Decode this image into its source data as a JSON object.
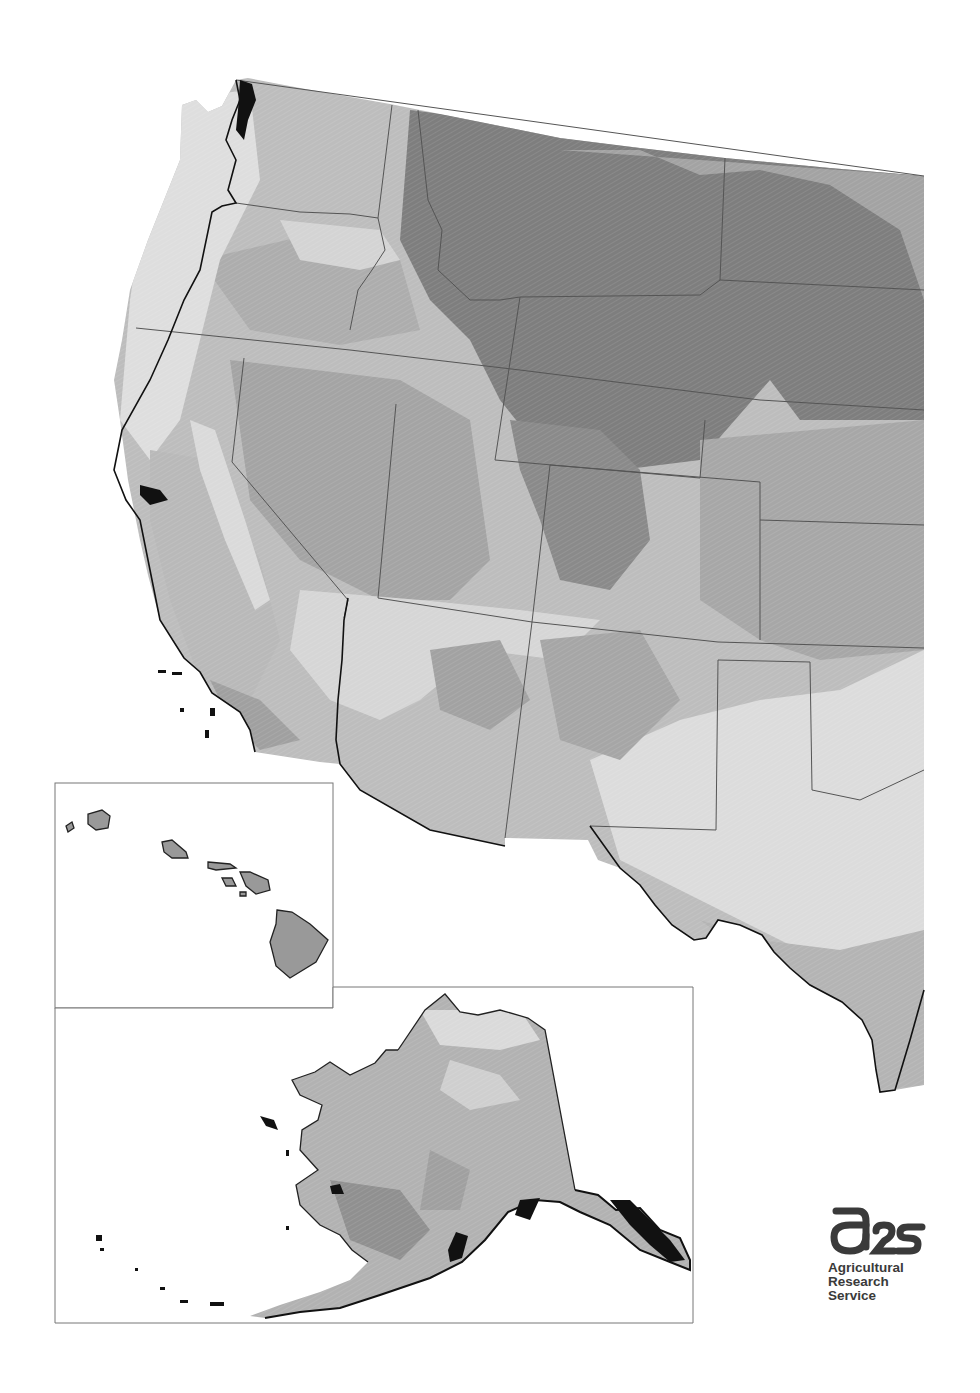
{
  "map": {
    "type": "grayscale-zone-map",
    "main_region": "western-united-states",
    "insets": [
      {
        "name": "hawaii-inset",
        "frame": [
          55,
          783,
          278,
          225
        ]
      },
      {
        "name": "alaska-inset",
        "frame": [
          55,
          987,
          638,
          336
        ]
      }
    ],
    "zone_colors": [
      "#e2e2e2",
      "#cfcfcf",
      "#bdbdbd",
      "#a9a9a9",
      "#979797",
      "#888888",
      "#7a7a7a"
    ],
    "border_color": "#555555",
    "coast_color": "#111111"
  },
  "logo": {
    "mark": "ars",
    "line1": "Agricultural",
    "line2": "Research",
    "line3": "Service",
    "color": "#3a3a3a"
  }
}
